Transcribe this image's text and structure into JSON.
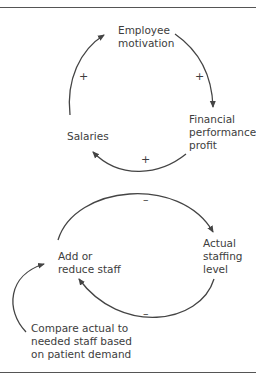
{
  "diagram": {
    "loop1": {
      "nodes": {
        "employee_motivation": "Employee\nmotivation",
        "financial_performance": "Financial\nperformance,\nprofit",
        "salaries": "Salaries"
      },
      "signs": {
        "salaries_to_motivation": "+",
        "motivation_to_financial": "+",
        "financial_to_salaries": "+"
      }
    },
    "loop2": {
      "nodes": {
        "add_reduce_staff": "Add or\nreduce staff",
        "actual_staffing": "Actual\nstaffing\nlevel",
        "compare": "Compare actual to\nneeded staff based\non patient demand"
      },
      "signs": {
        "add_to_actual": "–",
        "actual_to_add": "–"
      }
    },
    "colors": {
      "line": "#444444",
      "text": "#3d3d3d",
      "rule": "#555555"
    }
  }
}
